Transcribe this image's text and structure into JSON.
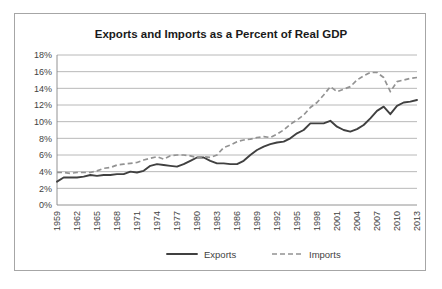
{
  "chart_data": {
    "type": "line",
    "title": "Exports and Imports as a Percent of Real GDP",
    "xlabel": "",
    "ylabel": "",
    "ylim": [
      0,
      18
    ],
    "ytick_labels": [
      "0%",
      "2%",
      "4%",
      "6%",
      "8%",
      "10%",
      "12%",
      "14%",
      "16%",
      "18%"
    ],
    "ytick_values": [
      0,
      2,
      4,
      6,
      8,
      10,
      12,
      14,
      16,
      18
    ],
    "grid": true,
    "legend_position": "bottom",
    "xlim": [
      1959,
      2013
    ],
    "xtick_labels": [
      "1959",
      "1962",
      "1965",
      "1968",
      "1971",
      "1974",
      "1977",
      "1980",
      "1983",
      "1986",
      "1989",
      "1992",
      "1995",
      "1998",
      "2001",
      "2004",
      "2007",
      "2010",
      "2013"
    ],
    "x": [
      1959,
      1960,
      1961,
      1962,
      1963,
      1964,
      1965,
      1966,
      1967,
      1968,
      1969,
      1970,
      1971,
      1972,
      1973,
      1974,
      1975,
      1976,
      1977,
      1978,
      1979,
      1980,
      1981,
      1982,
      1983,
      1984,
      1985,
      1986,
      1987,
      1988,
      1989,
      1990,
      1991,
      1992,
      1993,
      1994,
      1995,
      1996,
      1997,
      1998,
      1999,
      2000,
      2001,
      2002,
      2003,
      2004,
      2005,
      2006,
      2007,
      2008,
      2009,
      2010,
      2011,
      2012,
      2013
    ],
    "series": [
      {
        "name": "Exports",
        "color": "#404040",
        "style": "solid",
        "values": [
          2.8,
          3.3,
          3.3,
          3.3,
          3.4,
          3.6,
          3.5,
          3.6,
          3.6,
          3.7,
          3.7,
          4.0,
          3.9,
          4.1,
          4.7,
          4.9,
          4.8,
          4.7,
          4.6,
          4.9,
          5.3,
          5.7,
          5.7,
          5.3,
          5.0,
          5.0,
          4.9,
          4.9,
          5.3,
          6.0,
          6.6,
          7.0,
          7.3,
          7.5,
          7.6,
          8.0,
          8.6,
          9.0,
          9.8,
          9.8,
          9.8,
          10.1,
          9.4,
          9.0,
          8.8,
          9.1,
          9.6,
          10.4,
          11.3,
          11.8,
          10.9,
          11.9,
          12.3,
          12.4,
          12.6
        ]
      },
      {
        "name": "Imports",
        "color": "#939393",
        "style": "dashed",
        "values": [
          3.9,
          3.9,
          3.8,
          3.9,
          3.9,
          3.9,
          4.1,
          4.4,
          4.5,
          4.8,
          4.9,
          5.0,
          5.1,
          5.4,
          5.6,
          5.8,
          5.5,
          5.9,
          6.0,
          6.0,
          5.9,
          5.7,
          5.8,
          5.7,
          6.0,
          6.9,
          7.2,
          7.6,
          7.8,
          7.9,
          8.1,
          8.2,
          8.1,
          8.5,
          9.0,
          9.7,
          10.2,
          10.8,
          11.7,
          12.3,
          13.2,
          14.2,
          13.6,
          13.9,
          14.2,
          15.0,
          15.5,
          15.9,
          15.9,
          15.3,
          13.6,
          14.8,
          15.0,
          15.2,
          15.3
        ]
      }
    ]
  },
  "legend": {
    "items": [
      {
        "label": "Exports"
      },
      {
        "label": "Imports"
      }
    ]
  }
}
